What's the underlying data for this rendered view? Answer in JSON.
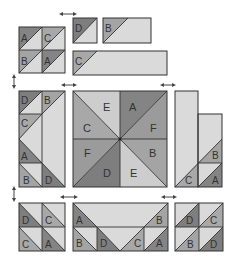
{
  "diagram": {
    "fabric_colors": {
      "light": "#dadada",
      "A": "#848484",
      "B": "#a4a4a4",
      "C": "#a8a8a8",
      "D": "#7e7e7e",
      "E": "#cdcdcd",
      "F": "#9b9b9b",
      "outline": "#333333"
    },
    "top_left_block": {
      "labels": [
        "A",
        "C",
        "B",
        "A"
      ]
    },
    "top_right_units": {
      "square_unit": "D",
      "short_rect_unit": "B",
      "long_rect_unit": "C"
    },
    "middle_left_block": {
      "left_column": [
        "D",
        "C",
        "A",
        "B"
      ],
      "right_column": [
        "B",
        "D"
      ]
    },
    "center_block": {
      "labels": {
        "top_left": "E",
        "top_right": "A",
        "right_top": "F",
        "right_bottom": "B",
        "bottom_right": "E",
        "bottom_left": "D",
        "left_bottom": "F",
        "left_top": "C"
      }
    },
    "middle_right_block": {
      "labels": [
        "C",
        "B",
        "A"
      ]
    },
    "bottom_left_block": {
      "labels": [
        "D",
        "C",
        "C",
        "A"
      ]
    },
    "bottom_middle_block": {
      "top_row": [
        "A",
        "B"
      ],
      "bottom_row": [
        "B",
        "D",
        "C",
        "A"
      ]
    },
    "bottom_right_block": {
      "labels": [
        "D",
        "C",
        "B",
        "D"
      ]
    },
    "arrows": {
      "horizontal": 5,
      "vertical": 2
    }
  }
}
